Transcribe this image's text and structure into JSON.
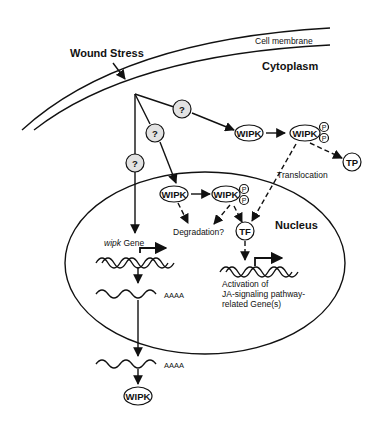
{
  "diagram": {
    "labels": {
      "wound_stress": "Wound Stress",
      "cell_membrane": "Cell membrane",
      "cytoplasm": "Cytoplasm",
      "nucleus": "Nucleus",
      "translocation": "Translocation",
      "degradation": "Degradation?",
      "wipk_gene_italic": "wipk",
      "wipk_gene_suffix": " Gene",
      "activation_line1": "Activation of",
      "activation_line2": "JA-signaling pathway-",
      "activation_line3": "related Gene(s)",
      "polyA_nuclear": "AAAA",
      "polyA_cytoplasmic": "AAAA"
    },
    "nodes": {
      "unknown_1": "?",
      "unknown_2": "?",
      "unknown_3": "?",
      "wipk_cyto": "WIPK",
      "wipk_cyto_p": "WIPK",
      "tp": "TP",
      "wipk_nuc": "WIPK",
      "wipk_nuc_p": "WIPK",
      "tf": "TF",
      "wipk_translated": "WIPK",
      "phospho": "P"
    }
  }
}
